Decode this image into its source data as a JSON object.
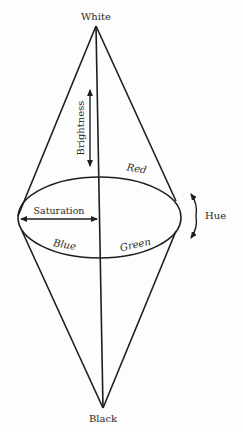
{
  "diagram": {
    "colors": {
      "line": "#1e1e1e",
      "text": "#2a2a2a",
      "background": "#fdfdfd"
    },
    "labels": {
      "top": "White",
      "bottom": "Black",
      "brightness": "Brightness",
      "saturation": "Saturation",
      "hue": "Hue",
      "red": "Red",
      "blue": "Blue",
      "green": "Green"
    }
  }
}
